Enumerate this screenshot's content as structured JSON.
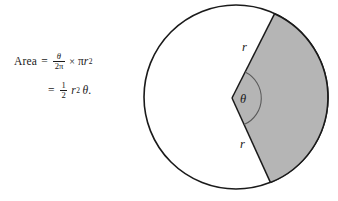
{
  "figure": {
    "type": "geometry-diagram",
    "background_color": "#ffffff",
    "stroke_color": "#1a1a1a",
    "sector_fill_color": "#b5b5b5",
    "circle": {
      "center_x": 236,
      "center_y": 97,
      "radius": 92,
      "fill": "#ffffff"
    },
    "sector": {
      "vertex_x": 232,
      "vertex_y": 98,
      "start_angle_deg": -72,
      "end_angle_deg": 68,
      "fill": "#b5b5b5"
    },
    "angle_arc": {
      "radius": 26,
      "stroke": "#555555"
    },
    "labels": {
      "radius_upper": "r",
      "radius_lower": "r",
      "angle": "θ"
    }
  },
  "formula": {
    "line1": {
      "lhs": "Area",
      "equals": "=",
      "fraction_numerator": "θ",
      "fraction_denominator": "2π",
      "times": "×",
      "pi": "π",
      "r": "r",
      "exponent": "2"
    },
    "line2": {
      "equals": "=",
      "fraction_numerator": "1",
      "fraction_denominator": "2",
      "r": "r",
      "exponent": "2",
      "theta": "θ",
      "period": "."
    },
    "plain_text_line1": "Area = θ/2π × πr²",
    "plain_text_line2": "= ½ r² θ."
  }
}
